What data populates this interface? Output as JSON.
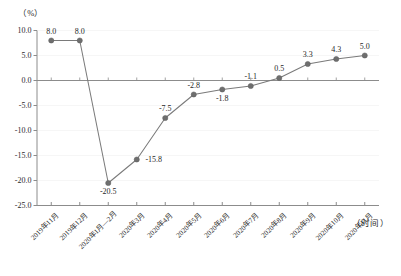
{
  "chart_data": {
    "type": "line",
    "title": "",
    "subtitle": "",
    "xlabel": "（时间）",
    "ylabel": "（%）",
    "ylim": [
      -25.0,
      10.0
    ],
    "yticks": [
      "10.0",
      "5.0",
      "0.0",
      "-5.0",
      "-10.0",
      "-15.0",
      "-20.0",
      "-25.0"
    ],
    "ytick_values": [
      10.0,
      5.0,
      0.0,
      -5.0,
      -10.0,
      -15.0,
      -20.0,
      -25.0
    ],
    "grid": "faint-horizontal",
    "legend": "none",
    "categories": [
      "2019年11月",
      "2019年12月",
      "2020年1月—2月",
      "2020年3月",
      "2020年4月",
      "2020年5月",
      "2020年6月",
      "2020年7月",
      "2020年8月",
      "2020年9月",
      "2020年10月",
      "2020年11月"
    ],
    "values": [
      8.0,
      8.0,
      -20.5,
      -15.8,
      -7.5,
      -2.8,
      -1.8,
      -1.1,
      0.5,
      3.3,
      4.3,
      5.0
    ],
    "point_labels": [
      "8.0",
      "8.0",
      "-20.5",
      "-15.8",
      "-7.5",
      "-2.8",
      "-1.8",
      "-1.1",
      "0.5",
      "3.3",
      "4.3",
      "5.0"
    ],
    "label_positions": [
      "above",
      "above",
      "below",
      "right",
      "above",
      "above",
      "below",
      "above",
      "above",
      "above",
      "above",
      "above"
    ],
    "series_color": "#7a7a7a",
    "marker_color": "#6e6e6e",
    "axis_color": "#8c8c8c",
    "text_color": "#2b2b2b"
  }
}
